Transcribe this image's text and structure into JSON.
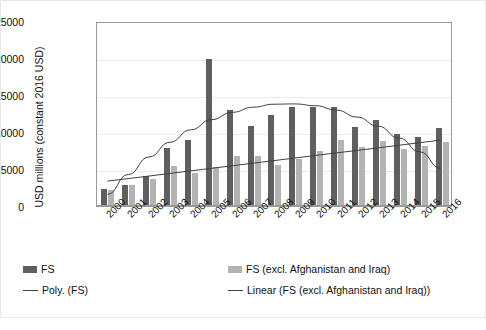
{
  "chart_data": {
    "type": "bar",
    "title": "",
    "xlabel": "",
    "ylabel": "USD millions (constant 2016 USD)",
    "categories": [
      "2000",
      "2001",
      "2002",
      "2003",
      "2004",
      "2005",
      "2006",
      "2007",
      "2008",
      "2009",
      "2010",
      "2011",
      "2012",
      "2013",
      "2014",
      "2015",
      "2016"
    ],
    "ylim": [
      0,
      25000
    ],
    "yticks": [
      "0",
      "5000",
      "10000",
      "15000",
      "20000",
      "25000"
    ],
    "ytick_values": [
      0,
      5000,
      10000,
      15000,
      20000,
      25000
    ],
    "grid": true,
    "legend_position": "bottom",
    "series": [
      {
        "name": "FS",
        "kind": "bar",
        "color": "#5f5f5f",
        "values": [
          2300,
          2900,
          4100,
          7900,
          8900,
          19900,
          13000,
          10800,
          12300,
          13400,
          13400,
          13400,
          10700,
          11600,
          9700,
          9300,
          10500
        ]
      },
      {
        "name": "FS (excl. Afghanistan and Iraq)",
        "kind": "bar",
        "color": "#b3b3b3",
        "values": [
          2200,
          2800,
          3600,
          5400,
          4400,
          5300,
          6800,
          6700,
          5500,
          6300,
          7400,
          8900,
          8000,
          8800,
          7700,
          8100,
          8600
        ]
      },
      {
        "name": "Poly.  (FS)",
        "kind": "trendline",
        "trend": "polynomial",
        "color": "#3f3f3f",
        "values": [
          1600,
          4300,
          6700,
          8700,
          10400,
          11800,
          12800,
          13500,
          13900,
          13950,
          13700,
          13100,
          12150,
          10900,
          9300,
          7400,
          5150
        ]
      },
      {
        "name": "Linear  (FS (excl. Afghanistan and Iraq))",
        "kind": "trendline",
        "trend": "linear",
        "color": "#3f3f3f",
        "values": [
          3400,
          3750,
          4100,
          4450,
          4800,
          5150,
          5500,
          5850,
          6200,
          6550,
          6900,
          7250,
          7600,
          7950,
          8300,
          8650,
          9000
        ]
      }
    ]
  },
  "legend": {
    "items": [
      {
        "label": "FS",
        "marker": "bar-dark"
      },
      {
        "label": "FS (excl. Afghanistan and Iraq)",
        "marker": "bar-light"
      },
      {
        "label": "Poly.  (FS)",
        "marker": "line"
      },
      {
        "label": "Linear  (FS (excl. Afghanistan and Iraq))",
        "marker": "line"
      }
    ]
  }
}
